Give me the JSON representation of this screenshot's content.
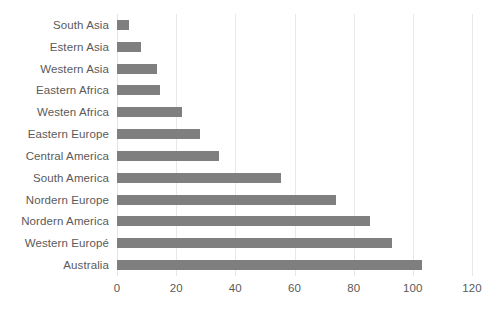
{
  "chart_data": {
    "type": "bar",
    "orientation": "horizontal",
    "title": "",
    "subtitle": "",
    "xlabel": "",
    "ylabel": "",
    "xlim": [
      0,
      120
    ],
    "xticks": [
      0,
      20,
      40,
      60,
      80,
      100,
      120
    ],
    "xtick_labels": [
      "0",
      "20",
      "40",
      "60",
      "80",
      "100",
      "120"
    ],
    "grid": true,
    "grid_axis": "x",
    "legend": false,
    "legend_position": "none",
    "bar_color": "#7f7f7f",
    "text_color": "#5a5a5a",
    "gridline_color": "#e8e8e8",
    "background_color": "#ffffff",
    "categories": [
      "South Asia",
      "Estern Asia",
      "Western Asia",
      "Eastern Africa",
      "Westen Africa",
      "Eastern Europe",
      "Central America",
      "South America",
      "Nordern Europe",
      "Nordern America",
      "Western Europé",
      "Australia"
    ],
    "values": [
      4,
      8,
      13.5,
      14.5,
      22,
      28,
      34.5,
      55.5,
      74,
      85.5,
      93,
      103
    ],
    "series": [
      {
        "name": "",
        "values": [
          4,
          8,
          13.5,
          14.5,
          22,
          28,
          34.5,
          55.5,
          74,
          85.5,
          93,
          103
        ]
      }
    ]
  }
}
